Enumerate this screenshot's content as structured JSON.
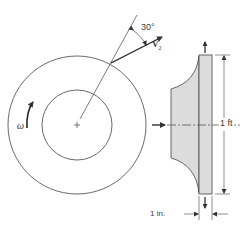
{
  "figure": {
    "type": "engineering-diagram",
    "labels": {
      "angle": "30°",
      "velocity_symbol": "V",
      "velocity_subscript": "2",
      "angular_velocity": "ω",
      "height_dimension": "1 ft",
      "width_dimension": "1 in."
    },
    "colors": {
      "line": "#444444",
      "fill": "#dcdcdc",
      "text": "#3a3a3a"
    },
    "front_view": {
      "center": [
        77,
        125
      ],
      "outer_radius": 69,
      "inner_radius": 35,
      "center_mark": "+"
    },
    "side_view": {
      "plate_x": [
        199,
        212
      ],
      "plate_y": [
        55,
        194
      ],
      "hub_left_x": 171
    }
  }
}
